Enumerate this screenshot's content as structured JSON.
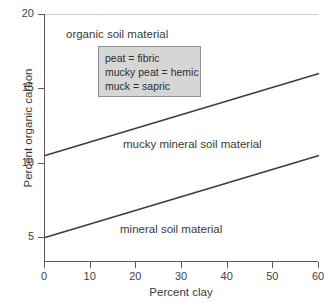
{
  "chart_data": {
    "type": "line",
    "title": "",
    "xlabel": "Percent clay",
    "ylabel": "Percent organic carbon",
    "xlim": [
      0,
      60
    ],
    "ylim": [
      3.35,
      20
    ],
    "grid": false,
    "legend_position": "inside-upper-left",
    "xticks": [
      {
        "value": 0,
        "label": "0"
      },
      {
        "value": 10,
        "label": "10"
      },
      {
        "value": 20,
        "label": "20"
      },
      {
        "value": 30,
        "label": "30"
      },
      {
        "value": 40,
        "label": "40"
      },
      {
        "value": 50,
        "label": "50"
      },
      {
        "value": 60,
        "label": "60"
      }
    ],
    "yticks": [
      {
        "value": 5,
        "label": "5"
      },
      {
        "value": 10,
        "label": "10"
      },
      {
        "value": 15,
        "label": "15"
      },
      {
        "value": 20,
        "label": "20"
      }
    ],
    "series": [
      {
        "name": "organic / mucky mineral boundary",
        "x": [
          0,
          60
        ],
        "values": [
          10.5,
          16.0
        ]
      },
      {
        "name": "mucky mineral / mineral boundary",
        "x": [
          0,
          60
        ],
        "values": [
          5.0,
          10.5
        ]
      }
    ],
    "annotations": [
      {
        "id": "organic",
        "text": "organic soil material",
        "x": 4,
        "y": 18.7
      },
      {
        "id": "mucky",
        "text": "mucky mineral soil material",
        "x": 17,
        "y": 11.3
      },
      {
        "id": "mineral",
        "text": "mineral soil material",
        "x": 17,
        "y": 5.6
      }
    ],
    "legend_box": {
      "lines": [
        "peat = fibric",
        "mucky peat = hemic",
        "muck = sapric"
      ],
      "background": "#d6d6d6",
      "border": "#8f8f8f"
    },
    "colors": {
      "line": "#3d3d3d",
      "axis": "#5a5a5a",
      "text": "#3a3a3a",
      "background": "#ffffff"
    }
  }
}
